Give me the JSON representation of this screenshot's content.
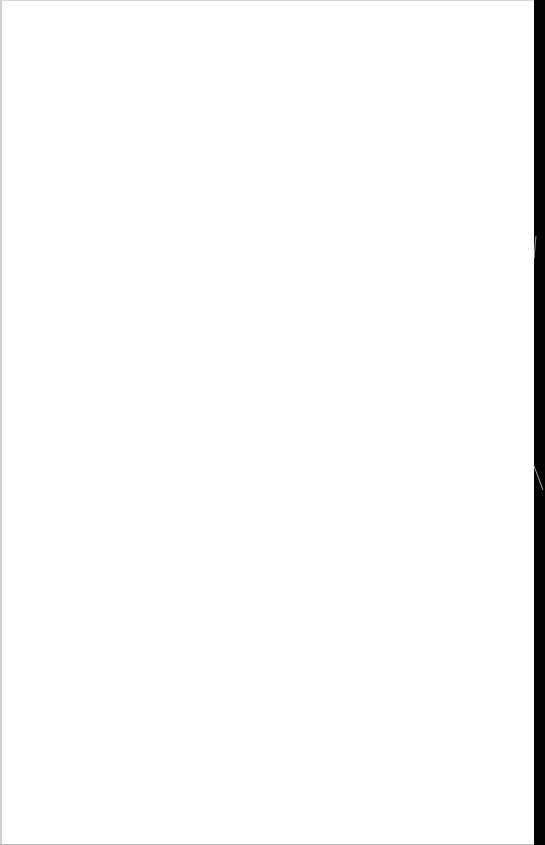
{
  "document": {
    "page_background": "#ffffff",
    "content_text": "",
    "is_blank": true
  },
  "scan_edge": {
    "color": "#000000",
    "marks": [
      {
        "name": "top-mark",
        "y": 245
      },
      {
        "name": "bottom-mark",
        "y": 478
      }
    ]
  }
}
